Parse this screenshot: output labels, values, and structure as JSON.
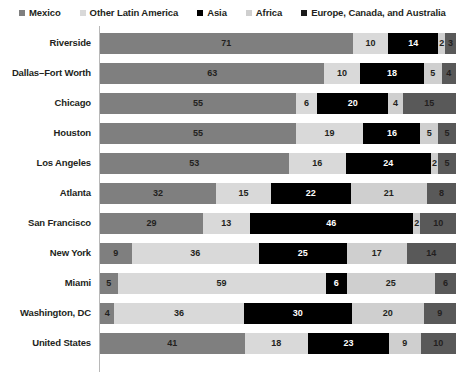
{
  "chart_data": {
    "type": "bar",
    "orientation": "horizontal",
    "stacked": true,
    "normalized_percent": true,
    "title": "",
    "subtitle": "",
    "xlabel": "",
    "ylabel": "",
    "xlim": [
      0,
      100
    ],
    "grid": false,
    "legend_position": "top",
    "categories": [
      "Riverside",
      "Dallas–Fort Worth",
      "Chicago",
      "Houston",
      "Los Angeles",
      "Atlanta",
      "San Francisco",
      "New York",
      "Miami",
      "Washington, DC",
      "United States"
    ],
    "series": [
      {
        "name": "Mexico",
        "color": "#7f7f7f",
        "label_color": "#231f20",
        "values": [
          71,
          63,
          55,
          55,
          53,
          32,
          29,
          9,
          5,
          4,
          41
        ]
      },
      {
        "name": "Other Latin America",
        "color": "#d9d9d9",
        "label_color": "#231f20",
        "values": [
          10,
          10,
          6,
          19,
          16,
          15,
          13,
          36,
          59,
          36,
          18
        ]
      },
      {
        "name": "Asia",
        "color": "#000000",
        "label_color": "#ffffff",
        "values": [
          14,
          18,
          20,
          16,
          24,
          22,
          46,
          25,
          6,
          30,
          23
        ]
      },
      {
        "name": "Africa",
        "color": "#cfcfcf",
        "label_color": "#231f20",
        "values": [
          2,
          5,
          4,
          5,
          2,
          21,
          2,
          17,
          25,
          20,
          9
        ]
      },
      {
        "name": "Europe, Canada, and Australia",
        "color": "#595959",
        "label_color": "#231f20",
        "values": [
          3,
          4,
          15,
          5,
          5,
          8,
          10,
          14,
          6,
          9,
          10
        ]
      }
    ]
  },
  "legend": {
    "items": [
      {
        "label": "Mexico",
        "color": "#7f7f7f"
      },
      {
        "label": "Other Latin America",
        "color": "#d9d9d9"
      },
      {
        "label": "Asia",
        "color": "#000000"
      },
      {
        "label": "Africa",
        "color": "#cfcfcf"
      },
      {
        "label": "Europe, Canada, and Australia",
        "color": "#1a1a1a"
      }
    ]
  },
  "axis": {
    "line_color": "#b8b8b8"
  }
}
